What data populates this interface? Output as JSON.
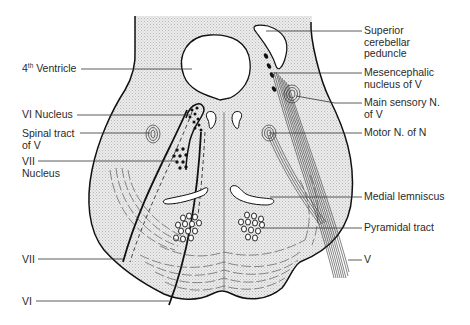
{
  "figure": {
    "colors": {
      "tissue_fill": "#e4e4e4",
      "outline": "#111111",
      "leader": "#333333",
      "text": "#2a2a2a"
    }
  },
  "labels_left": [
    {
      "id": "fourth-ventricle",
      "main": "4",
      "sup": "th",
      "rest": " Ventricle"
    },
    {
      "id": "vi-nucleus",
      "text": "VI Nucleus"
    },
    {
      "id": "spinal-tract-v",
      "line1": "Spinal tract",
      "line2": "of V"
    },
    {
      "id": "vii-nucleus",
      "line1": "VII",
      "line2": "Nucleus"
    },
    {
      "id": "vii",
      "text": "VII"
    },
    {
      "id": "vi",
      "text": "VI"
    }
  ],
  "labels_right": [
    {
      "id": "superior-cerebellar-peduncle",
      "line1": "Superior",
      "line2": "cerebellar",
      "line3": "peduncle"
    },
    {
      "id": "mesencephalic-nucleus-v",
      "line1": "Mesencephalic",
      "line2": "nucleus of V"
    },
    {
      "id": "main-sensory-n-v",
      "line1": "Main sensory N.",
      "line2": "of V"
    },
    {
      "id": "motor-n",
      "text": "Motor N. of N"
    },
    {
      "id": "medial-lemniscus",
      "text": "Medial lemniscus"
    },
    {
      "id": "pyramidal-tract",
      "text": "Pyramidal tract"
    },
    {
      "id": "v",
      "text": "V"
    }
  ]
}
